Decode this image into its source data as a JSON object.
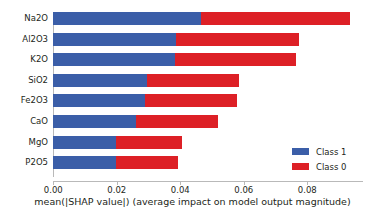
{
  "chart_data": {
    "type": "bar",
    "orientation": "horizontal",
    "stacked": true,
    "title": "",
    "xlabel": "mean(|SHAP value|) (average impact on model output magnitude)",
    "ylabel": "",
    "categories": [
      "Na2O",
      "Al2O3",
      "K2O",
      "SiO2",
      "Fe2O3",
      "CaO",
      "MgO",
      "P2O5"
    ],
    "series": [
      {
        "name": "Class 1",
        "color": "#3b5ea8",
        "values": [
          0.0465,
          0.0386,
          0.0382,
          0.0295,
          0.0288,
          0.026,
          0.0197,
          0.0197
        ]
      },
      {
        "name": "Class 0",
        "color": "#dd2026",
        "values": [
          0.0469,
          0.0389,
          0.0383,
          0.029,
          0.0292,
          0.0258,
          0.0208,
          0.0196
        ]
      }
    ],
    "totals": [
      0.0934,
      0.0775,
      0.0765,
      0.0585,
      0.058,
      0.0518,
      0.0405,
      0.0393
    ],
    "xlim": [
      0.0,
      0.0975
    ],
    "xticks": [
      0.0,
      0.02,
      0.04,
      0.06,
      0.08
    ],
    "xticklabels": [
      "0.00",
      "0.02",
      "0.04",
      "0.06",
      "0.08"
    ],
    "grid": false,
    "legend_position": "lower right",
    "legend": [
      "Class 1",
      "Class 0"
    ]
  },
  "axis": {
    "x_title": "mean(|SHAP value|) (average impact on model output magnitude)",
    "ticks": [
      {
        "label": "0.00"
      },
      {
        "label": "0.02"
      },
      {
        "label": "0.04"
      },
      {
        "label": "0.06"
      },
      {
        "label": "0.08"
      }
    ],
    "categories": [
      {
        "label": "Na2O"
      },
      {
        "label": "Al2O3"
      },
      {
        "label": "K2O"
      },
      {
        "label": "SiO2"
      },
      {
        "label": "Fe2O3"
      },
      {
        "label": "CaO"
      },
      {
        "label": "MgO"
      },
      {
        "label": "P2O5"
      }
    ]
  },
  "legend": {
    "entries": [
      {
        "label": "Class 1",
        "color": "#3b5ea8"
      },
      {
        "label": "Class 0",
        "color": "#dd2026"
      }
    ]
  }
}
